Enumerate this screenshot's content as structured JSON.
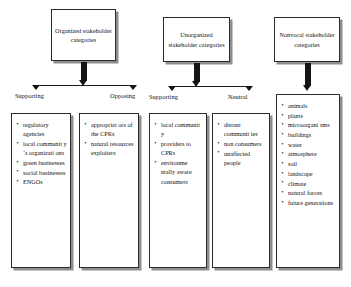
{
  "diagram": {
    "groups": [
      {
        "id": "organized",
        "header": "Organized stakeholder categories",
        "branches": [
          {
            "label": "Supporting",
            "items": [
              "regulatory agencies",
              "local communit y´s organizati ons",
              "green businesses",
              "social businesses",
              "ENGOs"
            ]
          },
          {
            "label": "Opposing",
            "items": [
              "appropriat ors of the CPRs",
              "natural resources exploiters"
            ]
          }
        ]
      },
      {
        "id": "unorganized",
        "header": "Unorganized stakeholder categories",
        "branches": [
          {
            "label": "Supporting",
            "items": [
              "local communit y",
              "providers to CPRs",
              "environme ntally aware consumers"
            ]
          },
          {
            "label": "Neutral",
            "items": [
              "distant communit ies",
              "non consumers",
              "unaffected people"
            ]
          }
        ]
      },
      {
        "id": "nonvocal",
        "header": "Nonvocal stakeholder categories",
        "branches": [
          {
            "label": "",
            "items": [
              "animals",
              "plants",
              "microorgani sms",
              "buildings",
              "water",
              "atmosphere",
              "soil",
              "landscape",
              "climate",
              "natural forces",
              "future generations"
            ]
          }
        ]
      }
    ],
    "colors": {
      "box_border": "#2b2b2b",
      "box_shadow": "#8e8e8e",
      "arrow": "#141414",
      "text": "#111111",
      "background": "#ffffff"
    }
  }
}
